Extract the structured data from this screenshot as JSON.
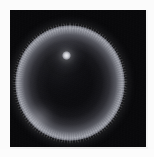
{
  "figure": {
    "kind": "astronomical-image",
    "panel": {
      "background_color": "#050507",
      "left_px": 10,
      "top_px": 10,
      "width_px": 136,
      "height_px": 137
    },
    "page_background_color": "#fbfbfb",
    "caption": ""
  },
  "objects": {
    "disk": {
      "name": "circular shell",
      "center_x_px": 70,
      "center_y_px": 83,
      "radius_x_px": 55,
      "radius_y_px": 58,
      "limb_color": "#96989f",
      "interior_color": "#0c0c0f",
      "brightest_limb_sector": "south-west",
      "description": "bright limb-brightened annulus with dark interior"
    },
    "point_source": {
      "name": "compact bright source",
      "center_x_px": 66,
      "center_y_px": 55,
      "core_size_px": 9,
      "core_color": "#e8e9ec",
      "halo_color": "#aaacb4",
      "description": "unresolved bright knot offset up-left of shell center"
    },
    "halo": {
      "name": "outer glow",
      "color": "#82848c"
    }
  },
  "colors": {
    "panel_black": "#050507",
    "limb_gray": "#96989f",
    "core_white": "#e8e9ec",
    "paper_white": "#fbfbfb",
    "seam_gray": "#f3f3f3"
  }
}
